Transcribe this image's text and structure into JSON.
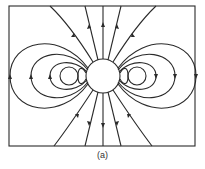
{
  "figure": {
    "caption": "(a)",
    "stroke_color": "#2a2a2a",
    "background": "#ffffff"
  }
}
